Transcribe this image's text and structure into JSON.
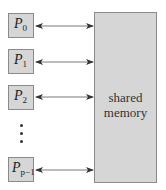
{
  "diagram": {
    "processors": [
      {
        "id": "P0",
        "label": "P",
        "sub": "0"
      },
      {
        "id": "P1",
        "label": "P",
        "sub": "1"
      },
      {
        "id": "P2",
        "label": "P",
        "sub": "2"
      },
      {
        "id": "Pp-1",
        "label": "P",
        "sub": "p−1"
      }
    ],
    "ellipsis": "⋮",
    "memory": {
      "line1": "shared",
      "line2": "memory"
    },
    "connections": [
      {
        "from": "P0",
        "to": "memory",
        "type": "bidirectional"
      },
      {
        "from": "P1",
        "to": "memory",
        "type": "bidirectional"
      },
      {
        "from": "P2",
        "to": "memory",
        "type": "bidirectional"
      },
      {
        "from": "Pp-1",
        "to": "memory",
        "type": "bidirectional"
      }
    ],
    "colors": {
      "box_fill": "#d6d6d6",
      "box_border": "#8a8a8a",
      "arrow": "#333333"
    }
  }
}
